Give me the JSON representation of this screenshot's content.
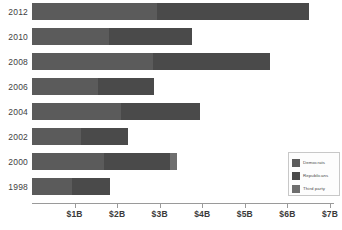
{
  "chart_data": {
    "type": "bar",
    "orientation": "horizontal",
    "stacked": true,
    "title": "",
    "subtitle": "",
    "xlabel": "",
    "ylabel": "",
    "categories": [
      "2012",
      "2010",
      "2008",
      "2006",
      "2004",
      "2002",
      "2000",
      "1998"
    ],
    "tick_labels": [
      "$1B",
      "$2B",
      "$3B",
      "$4B",
      "$5B",
      "$6B",
      "$7B"
    ],
    "tick_values": [
      1,
      2,
      3,
      4,
      5,
      6,
      7
    ],
    "xlim": [
      0,
      7
    ],
    "grid": false,
    "legend_position": "bottom-right",
    "units": "billions of US dollars",
    "series": [
      {
        "name": "Democrats",
        "color": "#5b5b5b",
        "values": [
          2.93,
          1.8,
          2.85,
          1.55,
          2.1,
          1.15,
          1.7,
          0.95
        ]
      },
      {
        "name": "Republicans",
        "color": "#4a4a4a",
        "values": [
          3.57,
          1.95,
          2.75,
          1.32,
          1.85,
          1.1,
          1.55,
          0.88
        ]
      },
      {
        "name": "Third party",
        "color": "#6e6e6e",
        "values": [
          0.0,
          0.0,
          0.0,
          0.0,
          0.0,
          0.0,
          0.15,
          0.0
        ]
      }
    ],
    "totals": [
      6.5,
      3.75,
      5.6,
      2.87,
      3.95,
      2.25,
      3.4,
      1.83
    ]
  },
  "legend": {
    "entries": [
      {
        "label": "Democrats"
      },
      {
        "label": "Republicans"
      },
      {
        "label": "Third party"
      }
    ]
  },
  "colors": {
    "axis": "#9a9a9a",
    "text": "#3f3f3f",
    "background": "#ffffff"
  }
}
